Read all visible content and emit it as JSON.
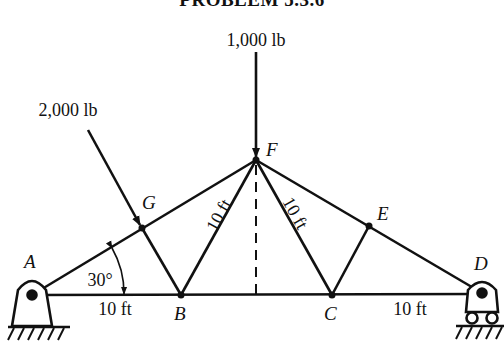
{
  "title": "PROBLEM 5.3.6",
  "loads": {
    "vertical": {
      "label": "1,000 lb",
      "node": "F"
    },
    "inclined": {
      "label": "2,000 lb",
      "node": "G"
    }
  },
  "nodes": {
    "A": {
      "label": "A",
      "x": 32,
      "y": 295
    },
    "B": {
      "label": "B",
      "x": 181,
      "y": 295
    },
    "C": {
      "label": "C",
      "x": 332,
      "y": 295
    },
    "D": {
      "label": "D",
      "x": 482,
      "y": 293
    },
    "E": {
      "label": "E",
      "x": 369,
      "y": 226
    },
    "F": {
      "label": "F",
      "x": 256,
      "y": 160
    },
    "G": {
      "label": "G",
      "x": 142,
      "y": 228
    }
  },
  "dimensions": {
    "AB": "10 ft",
    "CD": "10 ft",
    "BF": "10 ft",
    "CF": "10 ft",
    "angle": "30°"
  },
  "supports": {
    "A": "pin",
    "D": "roller"
  }
}
